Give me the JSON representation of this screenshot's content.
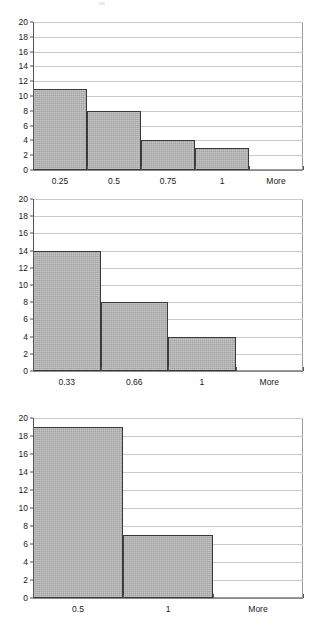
{
  "page": {
    "background": "#ffffff",
    "bar_fill": "#a3a3a3",
    "bar_border": "#3a3a3a",
    "gridline_color": "#c9c9c9",
    "axis_color": "#555555"
  },
  "charts": [
    {
      "name": "histogram-1",
      "categories": [
        "0.25",
        "0.5",
        "0.75",
        "1",
        "More"
      ],
      "values": [
        11,
        8,
        4,
        3,
        0
      ],
      "yticks": [
        "0",
        "2",
        "4",
        "6",
        "8",
        "10",
        "12",
        "14",
        "16",
        "18",
        "20"
      ],
      "ylim": [
        0,
        20
      ],
      "title": "",
      "xlabel": "",
      "ylabel": ""
    },
    {
      "name": "histogram-2",
      "categories": [
        "0.33",
        "0.66",
        "1",
        "More"
      ],
      "values": [
        14,
        8,
        4,
        0
      ],
      "yticks": [
        "0",
        "2",
        "4",
        "6",
        "8",
        "10",
        "12",
        "14",
        "16",
        "18",
        "20"
      ],
      "ylim": [
        0,
        20
      ],
      "title": "",
      "xlabel": "",
      "ylabel": ""
    },
    {
      "name": "histogram-3",
      "categories": [
        "0.5",
        "1",
        "More"
      ],
      "values": [
        19,
        7,
        0
      ],
      "yticks": [
        "0",
        "2",
        "4",
        "6",
        "8",
        "10",
        "12",
        "14",
        "16",
        "18",
        "20"
      ],
      "ylim": [
        0,
        20
      ],
      "title": "",
      "xlabel": "",
      "ylabel": ""
    }
  ],
  "chart_data": [
    {
      "type": "bar",
      "title": "",
      "xlabel": "",
      "ylabel": "",
      "categories": [
        "0.25",
        "0.5",
        "0.75",
        "1",
        "More"
      ],
      "values": [
        11,
        8,
        4,
        3,
        0
      ],
      "ylim": [
        0,
        20
      ],
      "ytick_step": 2,
      "grid": true,
      "legend": "none"
    },
    {
      "type": "bar",
      "title": "",
      "xlabel": "",
      "ylabel": "",
      "categories": [
        "0.33",
        "0.66",
        "1",
        "More"
      ],
      "values": [
        14,
        8,
        4,
        0
      ],
      "ylim": [
        0,
        20
      ],
      "ytick_step": 2,
      "grid": true,
      "legend": "none"
    },
    {
      "type": "bar",
      "title": "",
      "xlabel": "",
      "ylabel": "",
      "categories": [
        "0.5",
        "1",
        "More"
      ],
      "values": [
        19,
        7,
        0
      ],
      "ylim": [
        0,
        20
      ],
      "ytick_step": 2,
      "grid": true,
      "legend": "none"
    }
  ]
}
